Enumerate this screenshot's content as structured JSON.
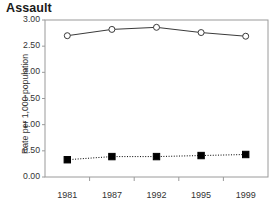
{
  "chart_data": {
    "type": "line",
    "title": "Assault",
    "xlabel": "",
    "ylabel": "Rate per 1,000 population",
    "categories": [
      "1981",
      "1987",
      "1992",
      "1995",
      "1999"
    ],
    "ylim": [
      0.0,
      3.0
    ],
    "ytick_labels": [
      "0.00",
      "0.50",
      "1.00",
      "1.50",
      "2.00",
      "2.50",
      "3.00"
    ],
    "ytick_values": [
      0.0,
      0.5,
      1.0,
      1.5,
      2.0,
      2.5,
      3.0
    ],
    "grid": false,
    "legend": "none",
    "series": [
      {
        "name": "series-open-circle",
        "marker": "open-circle",
        "line_style": "solid",
        "color": "#3a3a3a",
        "values": [
          2.7,
          2.82,
          2.86,
          2.76,
          2.69
        ]
      },
      {
        "name": "series-filled-square",
        "marker": "filled-square",
        "line_style": "dotted",
        "color": "#000000",
        "values": [
          0.33,
          0.39,
          0.39,
          0.41,
          0.43
        ]
      }
    ]
  },
  "figure": {
    "frame_color": "#9a9a9a",
    "background": "#ffffff",
    "bottom_fragment_text": ""
  }
}
